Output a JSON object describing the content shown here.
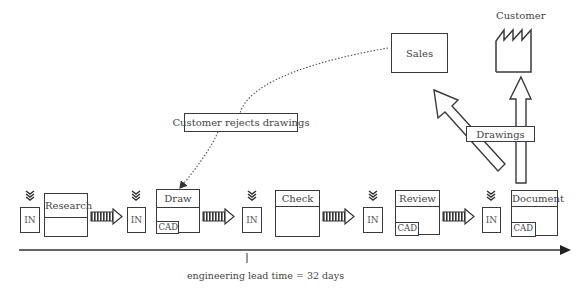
{
  "diagram": {
    "external": {
      "sales_label": "Sales",
      "customer_label": "Customer"
    },
    "feedback": {
      "label": "Customer rejects drawings"
    },
    "output": {
      "label": "Drawings"
    },
    "inventory_label": "IN",
    "processes": [
      {
        "name": "Research",
        "has_cad": false
      },
      {
        "name": "Draw",
        "has_cad": true,
        "cad_label": "CAD"
      },
      {
        "name": "Check",
        "has_cad": false
      },
      {
        "name": "Review",
        "has_cad": true,
        "cad_label": "CAD"
      },
      {
        "name": "Document",
        "has_cad": true,
        "cad_label": "CAD"
      }
    ],
    "timeline": {
      "label": "engineering lead time = 32 days"
    },
    "icons": {
      "inventory": "push-chevron-icon",
      "flow": "push-arrow-icon",
      "customer": "factory-icon"
    }
  }
}
